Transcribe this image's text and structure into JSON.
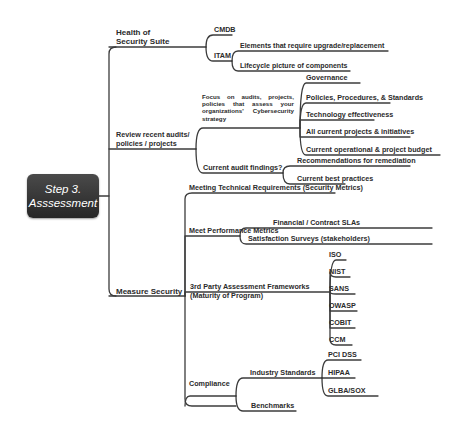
{
  "root": {
    "line1": "Step 3.",
    "line2": "Asssessment"
  },
  "branches": {
    "health": {
      "label_line1": "Health of",
      "label_line2": "Security Suite",
      "children": {
        "cmdb": "CMDB",
        "itam": {
          "label": "ITAM",
          "children": [
            "Elements that require upgrade/replacement",
            "Lifecycle picture of components"
          ]
        }
      }
    },
    "review": {
      "label_line1": "Review recent audits/",
      "label_line2": "policies / projects",
      "children": {
        "focus": {
          "label": "Focus on audits, projects, policies that assess your organizations' Cybersecurity strategy",
          "children": [
            "Governance",
            "Policies, Procedures, & Standards",
            "Technology effectiveness",
            "All current projects & initiatives",
            "Current operational & project budget"
          ]
        },
        "findings": {
          "label": "Current audit findings?",
          "children": [
            "Recommendations for remediation",
            "Current best practices"
          ]
        }
      }
    },
    "measure": {
      "label": "Measure Security",
      "children": {
        "technical": "Meeting Technical Requirements (Security Metrics)",
        "performance": {
          "label": "Meet Performance Metrics",
          "children": [
            "Financial / Contract SLAs",
            "Satisfaction Surveys (stakeholders)"
          ]
        },
        "frameworks": {
          "label_line1": "3rd Party Assessment Frameworks",
          "label_line2": "(Maturity of Program)",
          "children": [
            "ISO",
            "NIST",
            "SANS",
            "OWASP",
            "COBIT",
            "CCM"
          ]
        },
        "compliance": {
          "label": "Compliance",
          "children": {
            "industry": {
              "label": "Industry Standards",
              "children": [
                "PCI DSS",
                "HIPAA",
                "GLBA/SOX"
              ]
            },
            "benchmarks": "Benchmarks"
          }
        }
      }
    }
  },
  "colors": {
    "root_bg": "#333333",
    "root_text": "#ffffff",
    "line": "#3c3c3c",
    "text": "#2b2b2b"
  }
}
